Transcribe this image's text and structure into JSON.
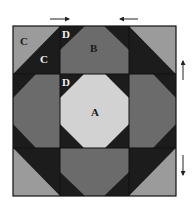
{
  "diagram": {
    "colors": {
      "light": "#9b9b9b",
      "dark": "#1c1c1c",
      "medium": "#6b6b6b",
      "center": "#d2d2d2",
      "outline": "#111111",
      "arrow": "#222222",
      "label_dark": "#1a1a1a",
      "label_light": "#f2f2f2"
    },
    "grid": {
      "x": [
        13,
        60,
        129,
        176
      ],
      "y": [
        26,
        74,
        148,
        196
      ]
    },
    "pieces": [
      {
        "name": "corner-top-left-light-c",
        "fill": "light",
        "points": "13,26 60,26 13,74"
      },
      {
        "name": "corner-top-left-dark-c",
        "fill": "dark",
        "points": "60,26 60,74 13,74"
      },
      {
        "name": "corner-top-right-light",
        "fill": "light",
        "points": "129,26 176,26 176,74"
      },
      {
        "name": "corner-top-right-dark",
        "fill": "dark",
        "points": "129,26 176,74 129,74"
      },
      {
        "name": "corner-bottom-left-light",
        "fill": "light",
        "points": "13,148 13,196 60,196"
      },
      {
        "name": "corner-bottom-left-dark",
        "fill": "dark",
        "points": "13,148 60,148 60,196"
      },
      {
        "name": "corner-bottom-right-light",
        "fill": "light",
        "points": "176,148 176,196 129,196"
      },
      {
        "name": "corner-bottom-right-dark",
        "fill": "dark",
        "points": "129,148 176,148 129,196"
      },
      {
        "name": "top-middle-dark-bg",
        "fill": "dark",
        "points": "60,26 129,26 129,74 60,74"
      },
      {
        "name": "top-middle-b",
        "fill": "medium",
        "points": "85,26 104,26 129,50 129,74 60,74 60,50"
      },
      {
        "name": "bottom-middle-dark-bg",
        "fill": "dark",
        "points": "60,148 129,148 129,196 60,196"
      },
      {
        "name": "bottom-middle-b",
        "fill": "medium",
        "points": "60,148 129,148 129,172 104,196 85,196 60,172"
      },
      {
        "name": "left-middle-dark-bg",
        "fill": "dark",
        "points": "13,74 60,74 60,148 13,148"
      },
      {
        "name": "left-middle-b",
        "fill": "medium",
        "points": "36,74 60,74 60,148 36,148 13,124 13,98"
      },
      {
        "name": "right-middle-dark-bg",
        "fill": "dark",
        "points": "129,74 176,74 176,148 129,148"
      },
      {
        "name": "right-middle-b",
        "fill": "medium",
        "points": "129,74 153,74 176,98 176,124 153,148 129,148"
      },
      {
        "name": "center-dark-bg",
        "fill": "dark",
        "points": "60,74 129,74 129,148 60,148"
      },
      {
        "name": "center-a",
        "fill": "center",
        "points": "84,74 105,74 129,98 129,124 105,148 84,148 60,124 60,98"
      }
    ],
    "dividers": [
      {
        "x1": 60,
        "y1": 26,
        "x2": 60,
        "y2": 196
      },
      {
        "x1": 129,
        "y1": 26,
        "x2": 129,
        "y2": 196
      },
      {
        "x1": 13,
        "y1": 74,
        "x2": 176,
        "y2": 74
      },
      {
        "x1": 13,
        "y1": 148,
        "x2": 176,
        "y2": 148
      }
    ],
    "labels": [
      {
        "name": "label-c-outer",
        "text": "C",
        "x": 20,
        "y": 45,
        "tone": "label_dark"
      },
      {
        "name": "label-c-inner",
        "text": "C",
        "x": 40,
        "y": 63,
        "tone": "label_light"
      },
      {
        "name": "label-d-top",
        "text": "D",
        "x": 62,
        "y": 38,
        "tone": "label_light"
      },
      {
        "name": "label-b",
        "text": "B",
        "x": 90,
        "y": 52,
        "tone": "label_dark"
      },
      {
        "name": "label-d-center",
        "text": "D",
        "x": 62,
        "y": 86,
        "tone": "label_light"
      },
      {
        "name": "label-a",
        "text": "A",
        "x": 91,
        "y": 116,
        "tone": "label_dark"
      }
    ],
    "arrows": [
      {
        "name": "arrow-right-icon",
        "direction": "right",
        "x1": 50,
        "y1": 19,
        "x2": 69,
        "y2": 19
      },
      {
        "name": "arrow-left-icon",
        "direction": "left",
        "x1": 138,
        "y1": 19,
        "x2": 120,
        "y2": 19
      },
      {
        "name": "arrow-up-icon",
        "direction": "up",
        "x1": 183,
        "y1": 80,
        "x2": 183,
        "y2": 61
      },
      {
        "name": "arrow-down-icon",
        "direction": "down",
        "x1": 183,
        "y1": 155,
        "x2": 183,
        "y2": 175
      }
    ]
  }
}
